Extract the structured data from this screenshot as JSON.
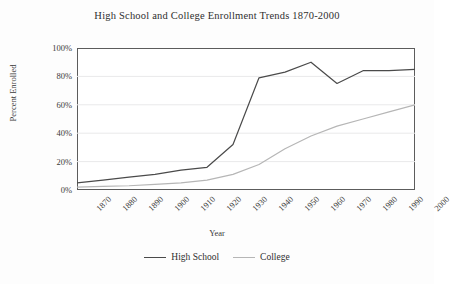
{
  "chart_data": {
    "type": "line",
    "title": "High School and College Enrollment Trends 1870-2000",
    "xlabel": "Year",
    "ylabel": "Percent Enrolled",
    "categories": [
      "1870",
      "1880",
      "1890",
      "1900",
      "1910",
      "1920",
      "1930",
      "1940",
      "1950",
      "1960",
      "1970",
      "1980",
      "1990",
      "2000"
    ],
    "x": [
      1870,
      1880,
      1890,
      1900,
      1910,
      1920,
      1930,
      1940,
      1950,
      1960,
      1970,
      1980,
      1990,
      2000
    ],
    "ylim": [
      0,
      100
    ],
    "yticks": [
      0,
      20,
      40,
      60,
      80,
      100
    ],
    "ytick_labels": [
      "0%",
      "20%",
      "40%",
      "60%",
      "80%",
      "100%"
    ],
    "grid": true,
    "grid_axis": "y",
    "legend_position": "bottom",
    "series": [
      {
        "name": "High School",
        "color": "#4a4a4a",
        "values": [
          5,
          7,
          9,
          11,
          14,
          16,
          32,
          79,
          83,
          90,
          75,
          84,
          84,
          85
        ]
      },
      {
        "name": "College",
        "color": "#b6b6b6",
        "values": [
          2,
          2.5,
          3,
          4,
          5,
          7,
          11,
          18,
          29,
          38,
          45,
          50,
          55,
          60
        ]
      }
    ]
  },
  "colors": {
    "high_school": "#4a4a4a",
    "college": "#b6b6b6",
    "axis": "#5c5c5c",
    "grid": "#e9e9ea",
    "text": "#2f2f2f"
  }
}
